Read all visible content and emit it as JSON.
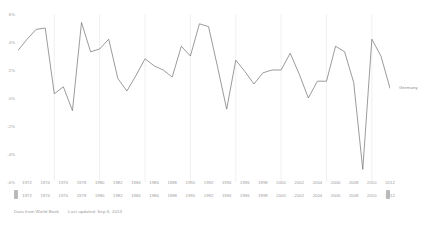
{
  "footer": {
    "source": "Data from World Bank",
    "updated": "Last updated: Sep 6, 2013"
  },
  "series_label": "Germany",
  "colors": {
    "line": "#7a7a7a",
    "grid": "#f0f0f0",
    "text": "#9b9b9b",
    "background": "#ffffff"
  },
  "chart_data": {
    "type": "line",
    "title": "",
    "subtitle": "",
    "xlabel": "",
    "ylabel": "",
    "legend": [
      "Germany"
    ],
    "legend_position": "right",
    "grid": true,
    "grid_axis": "x",
    "ylim": [
      -6,
      6
    ],
    "yticks": [
      6,
      4,
      2,
      0,
      -2,
      -4,
      -6
    ],
    "ytick_labels": [
      "6%",
      "4%",
      "2%",
      "0%",
      "-2%",
      "-4%",
      "-6%"
    ],
    "xlim": [
      1971,
      2012
    ],
    "xticks": [
      1972,
      1974,
      1976,
      1978,
      1980,
      1982,
      1984,
      1986,
      1988,
      1990,
      1992,
      1994,
      1996,
      1998,
      2000,
      2002,
      2004,
      2006,
      2008,
      2010,
      2012
    ],
    "xtick_labels_top": [
      "1972",
      "1974",
      "1976",
      "1978",
      "1980",
      "1982",
      "1984",
      "1986",
      "1988",
      "1990",
      "1992",
      "1994",
      "1996",
      "1998",
      "2000",
      "2002",
      "2004",
      "2006",
      "2008",
      "2010",
      "2012"
    ],
    "xtick_labels_bottom": [
      "1972",
      "1974",
      "1976",
      "1978",
      "1980",
      "1982",
      "1984",
      "1986",
      "1988",
      "1990",
      "1992",
      "1994",
      "1996",
      "1998",
      "2000",
      "2002",
      "2004",
      "2006",
      "2008",
      "2010",
      "2012"
    ],
    "gridline_years": [
      1975,
      1980,
      1985,
      1990,
      1995,
      2000,
      2005,
      2010
    ],
    "x": [
      1971,
      1972,
      1973,
      1974,
      1975,
      1976,
      1977,
      1978,
      1979,
      1980,
      1981,
      1982,
      1983,
      1984,
      1985,
      1986,
      1987,
      1988,
      1989,
      1990,
      1991,
      1992,
      1993,
      1994,
      1995,
      1996,
      1997,
      1998,
      1999,
      2000,
      2001,
      2002,
      2003,
      2004,
      2005,
      2006,
      2007,
      2008,
      2009,
      2010,
      2011,
      2012
    ],
    "series": [
      {
        "name": "Germany",
        "values": [
          3.4,
          4.2,
          4.9,
          5.0,
          0.3,
          0.8,
          -0.9,
          5.4,
          3.3,
          3.5,
          4.2,
          1.4,
          0.5,
          1.6,
          2.8,
          2.3,
          2.0,
          1.5,
          3.7,
          3.0,
          5.3,
          5.1,
          2.2,
          -0.8,
          2.7,
          1.9,
          1.0,
          1.8,
          2.0,
          2.0,
          3.2,
          1.7,
          0.0,
          1.2,
          1.2,
          3.7,
          3.3,
          1.1,
          -5.1,
          4.2,
          3.0,
          0.7
        ]
      }
    ]
  }
}
